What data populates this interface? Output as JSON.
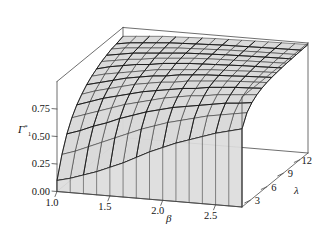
{
  "figure": {
    "title": "",
    "background": "#ffffff",
    "surface_fill": "#d9d9d9",
    "mesh_color": "#2b2b2b",
    "box_color": "#4a4a4a"
  },
  "chart_data": {
    "type": "surface",
    "title": "",
    "xlabel": "β",
    "ylabel": "λ",
    "zlabel": "Γ",
    "zlabel_sup": "*",
    "zlabel_sub": "1",
    "grid": false,
    "legend": "none",
    "xlim": [
      1.0,
      2.75
    ],
    "ylim": [
      1.5,
      13.5
    ],
    "zlim": [
      0.0,
      1.0
    ],
    "xticks": [
      1.0,
      1.5,
      2.0,
      2.5
    ],
    "xticklabels": [
      "1.0",
      "1.5",
      "2.0",
      "2.5"
    ],
    "yticks": [
      3,
      6,
      9,
      12
    ],
    "yticklabels": [
      "3",
      "6",
      "9",
      "12"
    ],
    "zticks": [
      0.0,
      0.25,
      0.5,
      0.75
    ],
    "zticklabels": [
      "0.00",
      "0.25",
      "0.50",
      "0.75"
    ],
    "x": [
      1.0,
      1.125,
      1.25,
      1.375,
      1.5,
      1.625,
      1.75,
      1.875,
      2.0,
      2.125,
      2.25,
      2.375,
      2.5,
      2.625,
      2.75
    ],
    "y": [
      1.5,
      2.4,
      3.3,
      4.2,
      5.1,
      6.0,
      6.9,
      7.8,
      8.7,
      9.6,
      10.5,
      11.4,
      12.3,
      13.5
    ],
    "z": [
      [
        0.1,
        0.3,
        0.45,
        0.56,
        0.64,
        0.7,
        0.75,
        0.79,
        0.82,
        0.85,
        0.87,
        0.89,
        0.9,
        0.92
      ],
      [
        0.13,
        0.34,
        0.49,
        0.6,
        0.68,
        0.74,
        0.78,
        0.82,
        0.85,
        0.87,
        0.89,
        0.91,
        0.92,
        0.93
      ],
      [
        0.17,
        0.39,
        0.54,
        0.64,
        0.72,
        0.77,
        0.81,
        0.84,
        0.87,
        0.89,
        0.91,
        0.92,
        0.93,
        0.94
      ],
      [
        0.21,
        0.44,
        0.58,
        0.68,
        0.75,
        0.8,
        0.84,
        0.86,
        0.89,
        0.9,
        0.92,
        0.93,
        0.94,
        0.95
      ],
      [
        0.26,
        0.49,
        0.63,
        0.72,
        0.78,
        0.83,
        0.86,
        0.88,
        0.9,
        0.92,
        0.93,
        0.94,
        0.95,
        0.955
      ],
      [
        0.31,
        0.54,
        0.67,
        0.75,
        0.81,
        0.85,
        0.88,
        0.9,
        0.92,
        0.93,
        0.94,
        0.95,
        0.955,
        0.96
      ],
      [
        0.37,
        0.59,
        0.71,
        0.78,
        0.83,
        0.87,
        0.89,
        0.91,
        0.93,
        0.94,
        0.95,
        0.955,
        0.96,
        0.965
      ],
      [
        0.43,
        0.63,
        0.74,
        0.81,
        0.85,
        0.88,
        0.91,
        0.92,
        0.94,
        0.95,
        0.955,
        0.96,
        0.965,
        0.97
      ],
      [
        0.48,
        0.67,
        0.77,
        0.83,
        0.87,
        0.9,
        0.92,
        0.93,
        0.945,
        0.955,
        0.96,
        0.965,
        0.97,
        0.972
      ],
      [
        0.53,
        0.7,
        0.79,
        0.85,
        0.88,
        0.91,
        0.93,
        0.94,
        0.95,
        0.96,
        0.965,
        0.97,
        0.972,
        0.975
      ],
      [
        0.57,
        0.73,
        0.81,
        0.86,
        0.9,
        0.92,
        0.935,
        0.945,
        0.955,
        0.962,
        0.968,
        0.972,
        0.975,
        0.978
      ],
      [
        0.61,
        0.76,
        0.83,
        0.88,
        0.91,
        0.93,
        0.94,
        0.95,
        0.96,
        0.966,
        0.971,
        0.975,
        0.978,
        0.98
      ],
      [
        0.65,
        0.78,
        0.85,
        0.89,
        0.92,
        0.937,
        0.947,
        0.956,
        0.963,
        0.969,
        0.974,
        0.977,
        0.98,
        0.982
      ],
      [
        0.68,
        0.8,
        0.86,
        0.9,
        0.925,
        0.942,
        0.952,
        0.96,
        0.966,
        0.972,
        0.976,
        0.979,
        0.982,
        0.984
      ],
      [
        0.71,
        0.82,
        0.875,
        0.91,
        0.932,
        0.947,
        0.957,
        0.964,
        0.97,
        0.975,
        0.978,
        0.981,
        0.984,
        0.986
      ]
    ],
    "view": {
      "azimuth_deg": -60,
      "elevation_deg": 22
    },
    "annotations": []
  },
  "axes": {
    "z_label_main": "Γ",
    "z_label_sup": "*",
    "z_label_sub": "1",
    "x_label": "β",
    "y_label": "λ"
  }
}
